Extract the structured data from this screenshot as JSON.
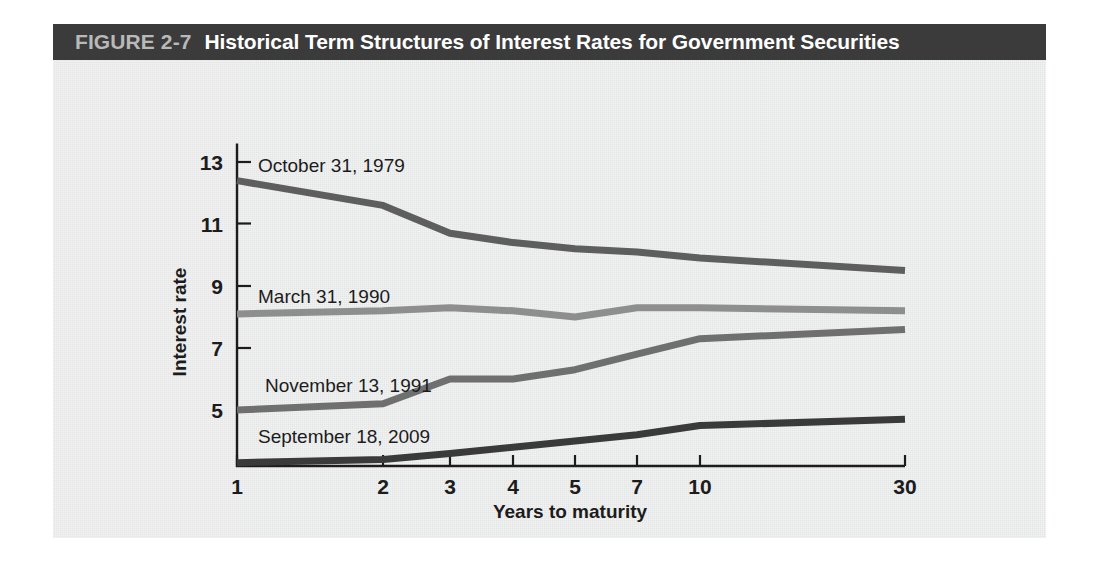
{
  "figure": {
    "number_label": "FIGURE 2-7",
    "title": "Historical Term Structures of Interest Rates for Government Securities",
    "title_bar_color": "#3b3b3b",
    "number_label_color": "#b9b9b9",
    "title_text_color": "#ffffff",
    "panel_color": "#e9eaea"
  },
  "chart_data": {
    "type": "line",
    "title": "Historical Term Structures of Interest Rates for Government Securities",
    "xlabel": "Years to maturity",
    "ylabel": "Interest rate",
    "x": [
      1,
      2,
      3,
      4,
      5,
      7,
      10,
      30
    ],
    "xtick_labels": [
      "1",
      "2",
      "3",
      "4",
      "5",
      "7",
      "10",
      "30"
    ],
    "ytick_labels": [
      "5",
      "7",
      "9",
      "11",
      "13"
    ],
    "yticks": [
      5,
      7,
      9,
      11,
      13
    ],
    "ylim": [
      3.2,
      13.6
    ],
    "grid": false,
    "legend_position": "inline-labels",
    "series": [
      {
        "name": "October 31, 1979",
        "color": "#5e5e5e",
        "values": [
          12.4,
          11.6,
          10.7,
          10.4,
          10.2,
          10.1,
          9.9,
          9.5
        ]
      },
      {
        "name": "March 31, 1990",
        "color": "#8e8e8e",
        "values": [
          8.1,
          8.2,
          8.3,
          8.2,
          8.0,
          8.3,
          8.3,
          8.2
        ]
      },
      {
        "name": "November 13, 1991",
        "color": "#6f6f6f",
        "values": [
          5.0,
          5.2,
          6.0,
          6.0,
          6.3,
          6.8,
          7.3,
          7.6
        ]
      },
      {
        "name": "September 18, 2009",
        "color": "#3a3a3a",
        "values": [
          3.3,
          3.4,
          3.6,
          3.8,
          4.0,
          4.2,
          4.5,
          4.7
        ]
      }
    ]
  },
  "series_labels": [
    {
      "text": "October 31, 1979",
      "x": 258,
      "y": 172
    },
    {
      "text": "March 31, 1990",
      "x": 258,
      "y": 303
    },
    {
      "text": "November 13, 1991",
      "x": 265,
      "y": 392
    },
    {
      "text": "September 18, 2009",
      "x": 258,
      "y": 443
    }
  ],
  "axis": {
    "x_pixels": [
      237,
      383,
      450,
      513,
      575,
      637,
      700,
      905
    ],
    "y_tick_pixels": {
      "13": 162,
      "11": 223.5,
      "9": 286,
      "7": 348,
      "5": 410
    },
    "baseline_y": 466,
    "axis_x": 237
  }
}
